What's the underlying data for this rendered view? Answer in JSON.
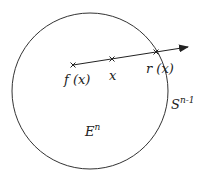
{
  "diagram": {
    "type": "geometry-retraction",
    "circle": {
      "cx": 90,
      "cy": 91,
      "r": 78,
      "stroke": "#333333"
    },
    "ray": {
      "from": [
        73,
        65
      ],
      "to": [
        188,
        47
      ],
      "stroke": "#222222"
    },
    "points": [
      {
        "name": "f-x",
        "x": 73,
        "y": 65,
        "label": "f (x)"
      },
      {
        "name": "x",
        "x": 112,
        "y": 59,
        "label": "x"
      },
      {
        "name": "r-x",
        "x": 156,
        "y": 52,
        "label": "r (x)"
      }
    ],
    "regions": {
      "disk_label_base": "E",
      "disk_label_sup": "n",
      "sphere_label_base": "S",
      "sphere_label_sup": "n-1"
    }
  }
}
